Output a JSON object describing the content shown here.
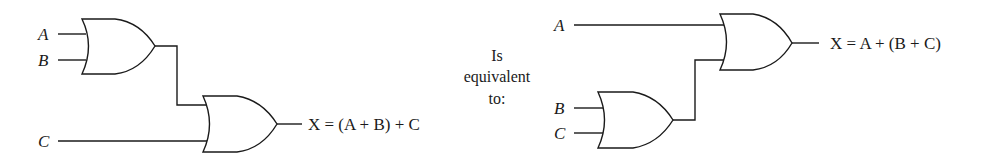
{
  "left_circuit": {
    "inputs": [
      {
        "label": "A"
      },
      {
        "label": "B"
      },
      {
        "label": "C"
      }
    ],
    "gates": [
      {
        "type": "OR",
        "inputs": [
          "A",
          "B"
        ]
      },
      {
        "type": "OR",
        "inputs": [
          "A + B",
          "C"
        ]
      }
    ],
    "output": {
      "var": "X",
      "expression": "X = (A + B) + C"
    }
  },
  "middle_text": {
    "line1": "Is",
    "line2": "equivalent",
    "line3": "to:"
  },
  "right_circuit": {
    "inputs": [
      {
        "label": "A"
      },
      {
        "label": "B"
      },
      {
        "label": "C"
      }
    ],
    "gates": [
      {
        "type": "OR",
        "inputs": [
          "B",
          "C"
        ]
      },
      {
        "type": "OR",
        "inputs": [
          "A",
          "B + C"
        ]
      }
    ],
    "output": {
      "var": "X",
      "expression": "X = A + (B + C)"
    }
  }
}
